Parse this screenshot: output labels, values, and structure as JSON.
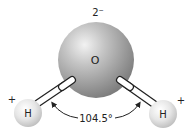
{
  "diagram": {
    "oxygen": {
      "symbol": "O",
      "charge": "2⁻"
    },
    "hydrogen_left": {
      "symbol": "H",
      "charge": "+"
    },
    "hydrogen_right": {
      "symbol": "H",
      "charge": "+"
    },
    "bond_angle": "104.5°",
    "colors": {
      "oxygen_light": "#e6e6e6",
      "oxygen_dark": "#7a7a7a",
      "hydrogen_light": "#ffffff",
      "hydrogen_dark": "#bdbdbd",
      "bond_fill": "#ffffff",
      "bond_stroke": "#222222",
      "text": "#222222"
    }
  }
}
